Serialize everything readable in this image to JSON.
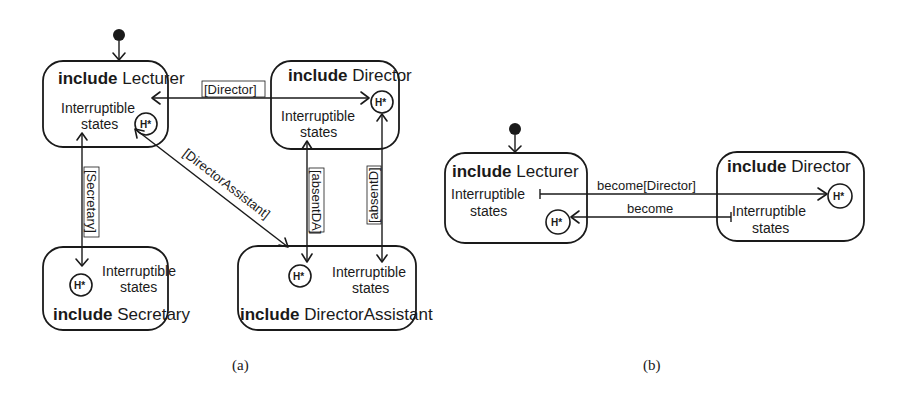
{
  "diagram_a": {
    "caption": "(a)",
    "states": {
      "lecturer": {
        "keyword": "include",
        "name": "Lecturer",
        "line1": "Interruptible",
        "line2": "states",
        "history": "H*"
      },
      "director": {
        "keyword": "include",
        "name": "Director",
        "line1": "Interruptible",
        "line2": "states",
        "history": "H*"
      },
      "secretary": {
        "keyword": "include",
        "name": "Secretary",
        "line1": "Interruptible",
        "line2": "states",
        "history": "H*"
      },
      "director_assistant": {
        "keyword": "include",
        "name": "DirectorAssistant",
        "line1": "Interruptible",
        "line2": "states",
        "history": "H*"
      }
    },
    "transitions": {
      "director": "[Director]",
      "secretary": "[Secretary]",
      "director_assistant": "[DirectorAssistant]",
      "absent_da": "[absentDA]",
      "absent_d": "[absentD]"
    }
  },
  "diagram_b": {
    "caption": "(b)",
    "states": {
      "lecturer": {
        "keyword": "include",
        "name": "Lecturer",
        "line1": "Interruptible",
        "line2": "states",
        "history": "H*"
      },
      "director": {
        "keyword": "include",
        "name": "Director",
        "line1": "Interruptible",
        "line2": "states",
        "history": "H*"
      }
    },
    "transitions": {
      "become_director": "become[Director]",
      "become": "become"
    }
  }
}
